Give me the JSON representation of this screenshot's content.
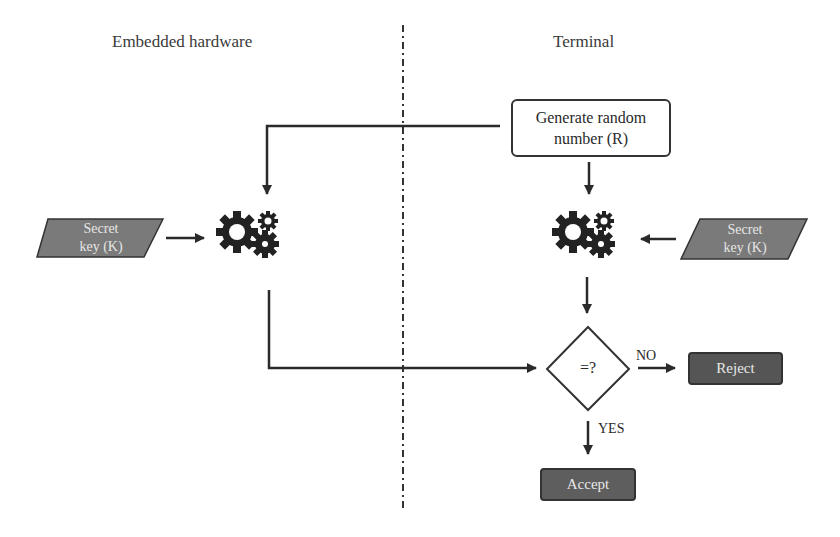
{
  "headings": {
    "left": "Embedded hardware",
    "right": "Terminal"
  },
  "nodes": {
    "generate": "Generate random number (R)",
    "generate_line1": "Generate random",
    "generate_line2": "number (R)",
    "secret_left_line1": "Secret",
    "secret_left_line2": "key (K)",
    "secret_right_line1": "Secret",
    "secret_right_line2": "key (K)",
    "compare": "=?",
    "reject": "Reject",
    "accept": "Accept"
  },
  "edge_labels": {
    "no": "NO",
    "yes": "YES"
  },
  "icons": {
    "left_processor": "gears-icon",
    "right_processor": "gears-icon"
  },
  "colors": {
    "line": "#2a2a2a",
    "dark_box": "#555555",
    "parallelogram": "#7a7a7a",
    "divider": "#333333"
  }
}
